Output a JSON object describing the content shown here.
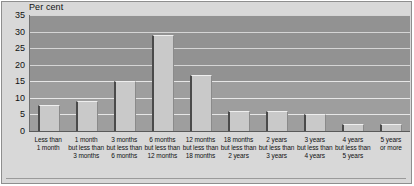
{
  "chart_data": {
    "type": "bar",
    "title": "",
    "subtitle": "",
    "xlabel": "",
    "ylabel": "Per cent",
    "ylim": [
      0,
      35
    ],
    "ytick_step": 5,
    "yticks": [
      0,
      5,
      10,
      15,
      20,
      25,
      30,
      35
    ],
    "grid": true,
    "legend": false,
    "categories": [
      "Less than\n1 month",
      "1 month\nbut less than\n3 months",
      "3 months\nbut less than\n6 months",
      "6 months\nbut less than\n12 months",
      "12 months\nbut less than\n18 months",
      "18 months\nbut less than\n2 years",
      "2 years\nbut less than\n3 years",
      "3 years\nbut less than\n4 years",
      "4 years\nbut less than\n5 years",
      "5 years\nor more"
    ],
    "values": [
      8,
      9,
      15,
      29,
      17,
      6,
      6,
      5,
      2,
      2
    ]
  },
  "axis": {
    "unit_caption": "Per cent"
  },
  "colors": {
    "bar_face": "#c9c9c9",
    "bar_shadow": "#4a4a4a",
    "plot_background": "#9e9e9e",
    "gridline": "#e6e6e6",
    "frame": "#8e8e8e",
    "page_background": "#d8d8d8",
    "text": "#111111"
  }
}
